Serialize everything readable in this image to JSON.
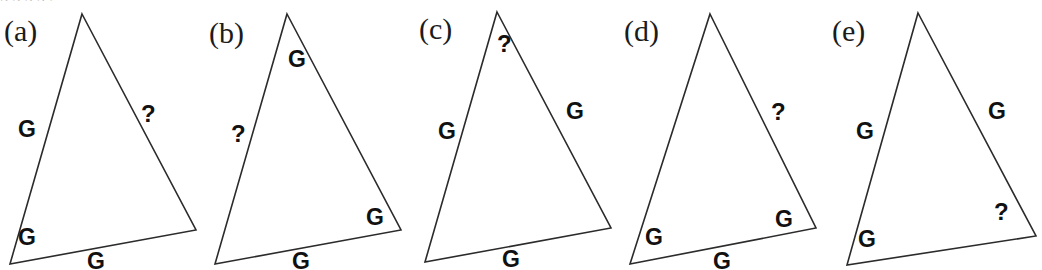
{
  "figure": {
    "background_color": "#ffffff",
    "stroke_color": "#2b2b2b",
    "label_color": "#111111",
    "tag_color": "#1b1b1b",
    "clipped_top_text": "g                                g                g                                                      g                 ,",
    "width": 1032,
    "height": 270,
    "given_symbol": "G",
    "unknown_symbol": "?"
  },
  "panels": [
    {
      "id": "a",
      "tag": "(a)",
      "tag_pos": {
        "x": 4,
        "y": 16
      },
      "origin_x": 0,
      "triangle": {
        "apex": [
          82,
          14
        ],
        "left": [
          10,
          264
        ],
        "right": [
          196,
          230
        ]
      },
      "marks": [
        {
          "name": "side-left-label",
          "text": "G",
          "x": 18,
          "y": 118,
          "kind": "given"
        },
        {
          "name": "side-right-label",
          "text": "?",
          "x": 141,
          "y": 102,
          "kind": "unknown"
        },
        {
          "name": "angle-left-label",
          "text": "G",
          "x": 18,
          "y": 226,
          "kind": "given"
        },
        {
          "name": "side-bottom-label",
          "text": "G",
          "x": 87,
          "y": 250,
          "kind": "given"
        }
      ]
    },
    {
      "id": "b",
      "tag": "(b)",
      "tag_pos": {
        "x": 4,
        "y": 18
      },
      "origin_x": 205,
      "triangle": {
        "apex": [
          82,
          14
        ],
        "left": [
          10,
          264
        ],
        "right": [
          196,
          230
        ]
      },
      "marks": [
        {
          "name": "angle-apex-label",
          "text": "G",
          "x": 83,
          "y": 48,
          "kind": "given"
        },
        {
          "name": "side-left-label",
          "text": "?",
          "x": 26,
          "y": 122,
          "kind": "unknown"
        },
        {
          "name": "angle-right-label",
          "text": "G",
          "x": 161,
          "y": 206,
          "kind": "given"
        },
        {
          "name": "side-bottom-label",
          "text": "G",
          "x": 87,
          "y": 250,
          "kind": "given"
        }
      ]
    },
    {
      "id": "c",
      "tag": "(c)",
      "tag_pos": {
        "x": 4,
        "y": 14
      },
      "origin_x": 415,
      "triangle": {
        "apex": [
          82,
          12
        ],
        "left": [
          10,
          262
        ],
        "right": [
          196,
          228
        ]
      },
      "marks": [
        {
          "name": "angle-apex-label",
          "text": "?",
          "x": 82,
          "y": 32,
          "kind": "unknown"
        },
        {
          "name": "side-right-label",
          "text": "G",
          "x": 151,
          "y": 100,
          "kind": "given"
        },
        {
          "name": "side-left-label",
          "text": "G",
          "x": 23,
          "y": 120,
          "kind": "given"
        },
        {
          "name": "side-bottom-label",
          "text": "G",
          "x": 87,
          "y": 248,
          "kind": "given"
        }
      ]
    },
    {
      "id": "d",
      "tag": "(d)",
      "tag_pos": {
        "x": 4,
        "y": 16
      },
      "origin_x": 620,
      "triangle": {
        "apex": [
          90,
          14
        ],
        "left": [
          10,
          264
        ],
        "right": [
          196,
          228
        ]
      },
      "marks": [
        {
          "name": "side-right-label",
          "text": "?",
          "x": 151,
          "y": 100,
          "kind": "unknown"
        },
        {
          "name": "angle-right-label",
          "text": "G",
          "x": 155,
          "y": 208,
          "kind": "given"
        },
        {
          "name": "angle-left-label",
          "text": "G",
          "x": 25,
          "y": 226,
          "kind": "given"
        },
        {
          "name": "side-bottom-label",
          "text": "G",
          "x": 93,
          "y": 250,
          "kind": "given"
        }
      ]
    },
    {
      "id": "e",
      "tag": "(e)",
      "tag_pos": {
        "x": 10,
        "y": 16
      },
      "origin_x": 822,
      "triangle": {
        "apex": [
          96,
          13
        ],
        "left": [
          25,
          265
        ],
        "right": [
          214,
          236
        ]
      },
      "marks": [
        {
          "name": "side-right-label",
          "text": "G",
          "x": 166,
          "y": 100,
          "kind": "given"
        },
        {
          "name": "side-left-label",
          "text": "G",
          "x": 34,
          "y": 120,
          "kind": "given"
        },
        {
          "name": "angle-right-label",
          "text": "?",
          "x": 172,
          "y": 200,
          "kind": "unknown"
        },
        {
          "name": "angle-left-label",
          "text": "G",
          "x": 36,
          "y": 228,
          "kind": "given"
        }
      ]
    }
  ]
}
